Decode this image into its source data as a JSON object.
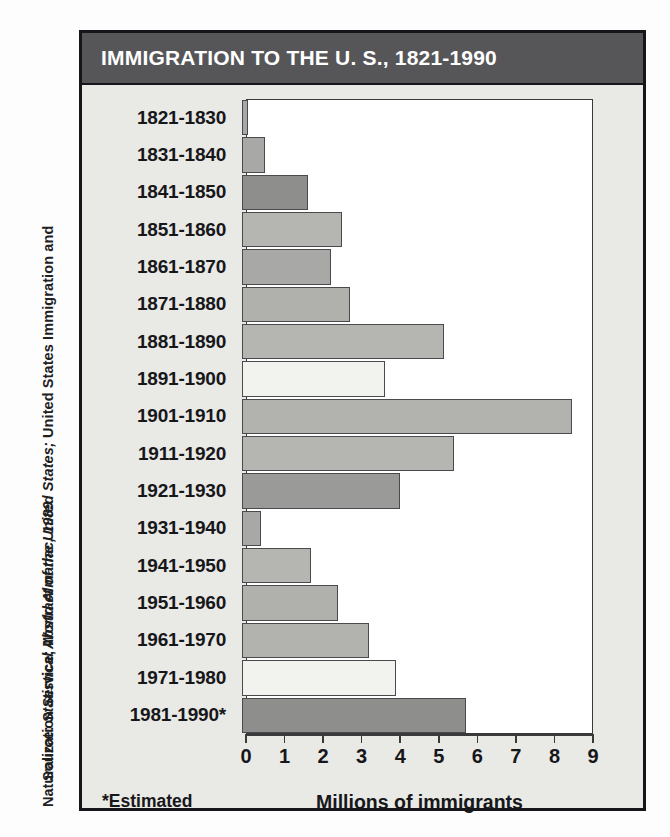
{
  "source_credit": {
    "line1_prefix": "Source: ",
    "line1_italic": "Statistical Abstract of the United States;",
    "line1_suffix": " United States Immigration and",
    "line2_prefix": "Naturalization Service; ",
    "line2_italic": "World Almanac, 1989"
  },
  "chart_data": {
    "type": "bar",
    "orientation": "horizontal",
    "title": "IMMIGRATION TO THE U. S., 1821-1990",
    "xlabel": "Millions of immigrants",
    "ylabel": "",
    "footnote": "*Estimated",
    "xlim": [
      0,
      9
    ],
    "xticks": [
      0,
      1,
      2,
      3,
      4,
      5,
      6,
      7,
      8,
      9
    ],
    "xtick_labels": [
      "0",
      "1",
      "2",
      "3",
      "4",
      "5",
      "6",
      "7",
      "8",
      "9"
    ],
    "grid": false,
    "legend": "none",
    "categories": [
      "1821-1830",
      "1831-1840",
      "1841-1850",
      "1851-1860",
      "1861-1870",
      "1871-1880",
      "1881-1890",
      "1891-1900",
      "1901-1910",
      "1911-1920",
      "1921-1930",
      "1931-1940",
      "1941-1950",
      "1951-1960",
      "1961-1970",
      "1971-1980",
      "1981-1990*"
    ],
    "values": [
      0.15,
      0.6,
      1.7,
      2.6,
      2.3,
      2.8,
      5.25,
      3.7,
      8.55,
      5.5,
      4.1,
      0.5,
      1.8,
      2.5,
      3.3,
      4.0,
      5.8
    ],
    "bar_colors": [
      "#a8a8a6",
      "#a8a8a6",
      "#8e8e8c",
      "#b5b5b2",
      "#a8a8a6",
      "#b0b0ad",
      "#b5b5b2",
      "#f2f2ef",
      "#b2b2af",
      "#b5b5b2",
      "#9a9a98",
      "#a8a8a6",
      "#b5b5b2",
      "#b0b0ad",
      "#b2b2af",
      "#f2f2ef",
      "#8e8e8c"
    ]
  },
  "colors": {
    "title_bar": "#565659",
    "title_text": "#ffffff",
    "card_background": "#e9e9e6",
    "plot_background": "#ffffff",
    "outline": "#16161a"
  }
}
